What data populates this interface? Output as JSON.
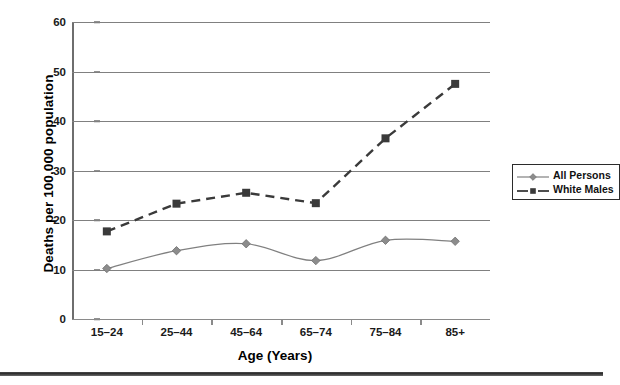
{
  "chart_data": {
    "type": "line",
    "title": "",
    "xlabel": "Age (Years)",
    "ylabel": "Deaths per 100,000 population",
    "categories": [
      "15–24",
      "25–44",
      "45–64",
      "65–74",
      "75–84",
      "85+"
    ],
    "ylim": [
      0,
      60
    ],
    "yticks": [
      0,
      10,
      20,
      30,
      40,
      50,
      60
    ],
    "grid": "horizontal",
    "legend_position": "right",
    "series": [
      {
        "name": "All Persons",
        "values": [
          10.2,
          13.8,
          15.2,
          11.8,
          15.9,
          15.7
        ],
        "color": "#808080",
        "line_style": "solid",
        "marker": "diamond"
      },
      {
        "name": "White Males",
        "values": [
          17.7,
          23.3,
          25.5,
          23.4,
          36.5,
          47.5
        ],
        "color": "#3a3a3a",
        "line_style": "dashed",
        "marker": "square"
      }
    ]
  },
  "axis": {
    "ytick_labels": [
      "0",
      "10",
      "20",
      "30",
      "40",
      "50",
      "60"
    ],
    "xtick_labels": [
      "15–24",
      "25–44",
      "45–64",
      "65–74",
      "75–84",
      "85+"
    ],
    "y_title": "Deaths per 100,000 population",
    "x_title": "Age (Years)"
  },
  "legend": {
    "items": [
      {
        "label": "All Persons"
      },
      {
        "label": "White Males"
      }
    ]
  },
  "colors": {
    "all_persons": "#808080",
    "white_males": "#3a3a3a",
    "gridline": "#808080",
    "text": "#000000"
  }
}
